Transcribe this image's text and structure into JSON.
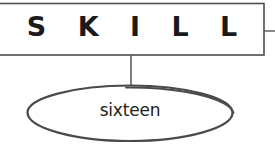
{
  "diagram": {
    "type": "tree-node-diagram",
    "background_color": "#ffffff",
    "header_box": {
      "label": "S K I L L",
      "plain_label": "SKILL",
      "border_color": "#4d4d4d",
      "fill_color": "#ffffff",
      "text_color": "#1a1a1a"
    },
    "connector": {
      "name": "vertical-connector",
      "color": "#555555"
    },
    "branch_stub": {
      "name": "right-branch-stub",
      "color": "#555555"
    },
    "node": {
      "label": "sixteen",
      "shape": "ellipse",
      "stroke_color": "#4a4a4a",
      "fill_color": "#ffffff",
      "text_color": "#222222"
    }
  }
}
